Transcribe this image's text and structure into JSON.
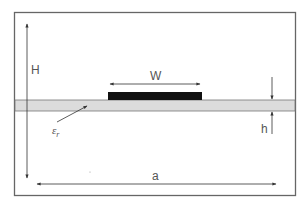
{
  "diagram": {
    "type": "microstrip cross-section",
    "colors": {
      "background": "#ffffff",
      "frame": "#666666",
      "substrate": "#dcdcdc",
      "strip": "#111111",
      "arrows": "#333333",
      "text": "#555555"
    },
    "labels": {
      "enclosure_height": "H",
      "strip_width": "W",
      "substrate_thickness": "h",
      "permittivity_symbol": "ε",
      "permittivity_subscript": "r",
      "enclosure_width": "a"
    }
  }
}
